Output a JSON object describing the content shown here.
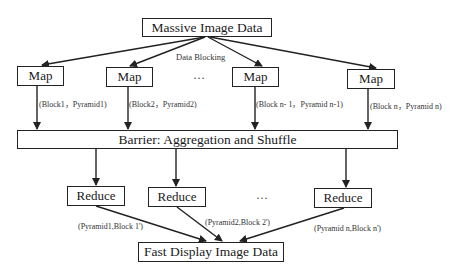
{
  "diagram": {
    "top": {
      "label": "Massive Image Data"
    },
    "blocking_label": "Data Blocking",
    "maps": [
      {
        "label": "Map",
        "output": "(Block1，Pyramid1)"
      },
      {
        "label": "Map",
        "output": "(Block2，Pyramid2)"
      },
      {
        "label": "Map",
        "output": "(Block n- 1，Pyramid n-1)"
      },
      {
        "label": "Map",
        "output": "(Block n，Pyramid n)"
      }
    ],
    "map_ellipsis": "…",
    "barrier": {
      "label": "Barrier: Aggregation and Shuffle"
    },
    "reduces": [
      {
        "label": "Reduce",
        "output": "(Pyramid1,Block 1')"
      },
      {
        "label": "Reduce",
        "output": "(Pyramid2,Block 2')"
      },
      {
        "label": "Reduce",
        "output": "(Pyramid n,Block n')"
      }
    ],
    "reduce_ellipsis": "…",
    "bottom": {
      "label": "Fast Display Image Data"
    },
    "colors": {
      "line": "#222222",
      "text": "#1a1a1a",
      "background": "#ffffff"
    }
  }
}
